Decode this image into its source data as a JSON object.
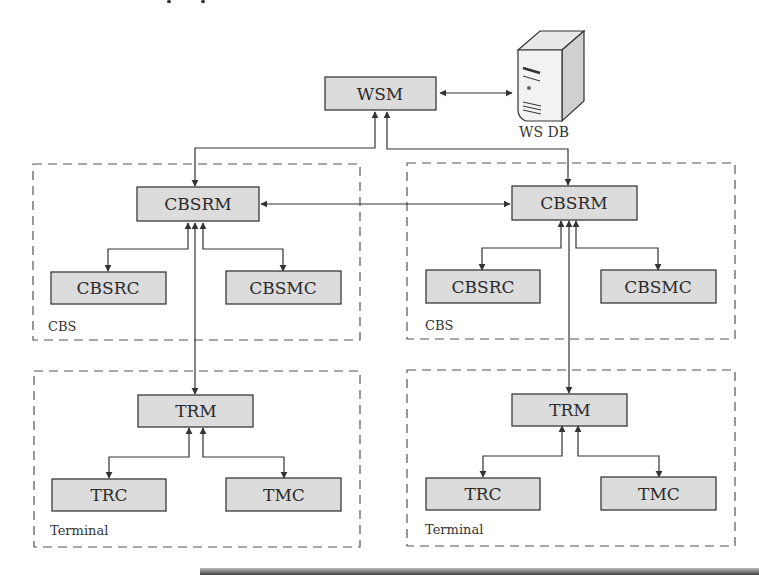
{
  "diagram": {
    "top": {
      "wsm": {
        "label": "WSM"
      },
      "db": {
        "label": "WS DB",
        "icon": "server-database-icon"
      }
    },
    "groups": [
      {
        "label": "CBS",
        "manager": {
          "label": "CBSRM"
        },
        "children": [
          {
            "label": "CBSRC"
          },
          {
            "label": "CBSMC"
          }
        ]
      },
      {
        "label": "CBS",
        "manager": {
          "label": "CBSRM"
        },
        "children": [
          {
            "label": "CBSRC"
          },
          {
            "label": "CBSMC"
          }
        ]
      },
      {
        "label": "Terminal",
        "manager": {
          "label": "TRM"
        },
        "children": [
          {
            "label": "TRC"
          },
          {
            "label": "TMC"
          }
        ]
      },
      {
        "label": "Terminal",
        "manager": {
          "label": "TRM"
        },
        "children": [
          {
            "label": "TRC"
          },
          {
            "label": "TMC"
          }
        ]
      }
    ],
    "colors": {
      "box_fill": "#dcdcdc",
      "box_stroke": "#3a3a3a",
      "line": "#333333"
    }
  }
}
